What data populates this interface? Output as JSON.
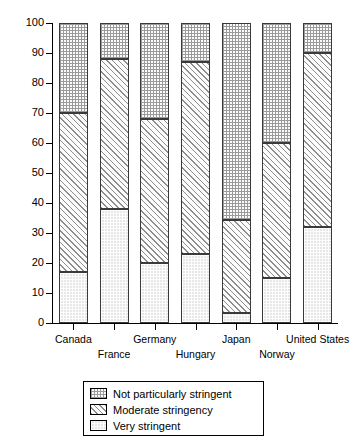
{
  "chart_data": {
    "type": "bar",
    "subtype": "stacked-bar-100",
    "title": "",
    "xlabel": "",
    "ylabel": "",
    "ylim": [
      0,
      100
    ],
    "yticks": [
      0,
      10,
      20,
      30,
      40,
      50,
      60,
      70,
      80,
      90,
      100
    ],
    "ytick_labels": [
      "0",
      "10",
      "20",
      "30",
      "40",
      "50",
      "60",
      "70",
      "80",
      "90",
      "100"
    ],
    "grid": false,
    "legend_position": "below-axes",
    "categories": [
      "Canada",
      "France",
      "Germany",
      "Hungary",
      "Japan",
      "Norway",
      "United States"
    ],
    "series": [
      {
        "name": "Very stringent",
        "pattern": "light-dots",
        "color": "#e7e7e7",
        "values": [
          17,
          38,
          20,
          23,
          3.5,
          15,
          32
        ]
      },
      {
        "name": "Moderate stringency",
        "pattern": "diagonal-hatch",
        "color": "#fcfcfc",
        "values": [
          53,
          50,
          48,
          64,
          31,
          45,
          58
        ]
      },
      {
        "name": "Not particularly stringent",
        "pattern": "cross-hatch",
        "color": "#fbfbfb",
        "values": [
          30,
          12,
          32,
          13,
          65.5,
          40,
          10
        ]
      }
    ],
    "cumulative_tops": {
      "Canada": [
        17,
        70,
        100
      ],
      "France": [
        38,
        88,
        100
      ],
      "Germany": [
        20,
        68,
        100
      ],
      "Hungary": [
        23,
        87,
        100
      ],
      "Japan": [
        3.5,
        34.5,
        100
      ],
      "Norway": [
        15,
        60,
        100
      ],
      "United States": [
        32,
        90,
        100
      ]
    }
  },
  "axis": {
    "y_tick_labels": [
      "100",
      "90",
      "80",
      "70",
      "60",
      "50",
      "40",
      "30",
      "20",
      "10",
      "0"
    ],
    "x_labels_top_row": [
      "Canada",
      "Germany",
      "Japan",
      "United States"
    ],
    "x_labels_bottom_row": [
      "France",
      "Hungary",
      "Norway"
    ]
  },
  "legend": {
    "items": [
      {
        "label": "Not particularly stringent",
        "pattern": "cross-hatch"
      },
      {
        "label": "Moderate stringency",
        "pattern": "diagonal-hatch"
      },
      {
        "label": "Very stringent",
        "pattern": "light-dots"
      }
    ]
  }
}
